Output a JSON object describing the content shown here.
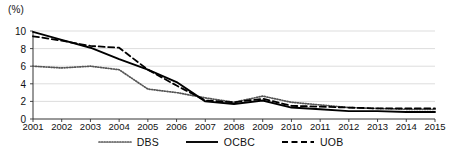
{
  "chart_data": {
    "type": "line",
    "title": "",
    "subtitle": "",
    "xlabel": "",
    "ylabel": "(%)",
    "unit_label": "(%)",
    "grid": true,
    "legend_position": "bottom",
    "xlim": [
      2001,
      2015
    ],
    "ylim": [
      0,
      10
    ],
    "yticks": [
      "0",
      "2",
      "4",
      "6",
      "8",
      "10"
    ],
    "ytick_values": [
      0,
      2,
      4,
      6,
      8,
      10
    ],
    "categories": [
      "2001",
      "2002",
      "2003",
      "2004",
      "2005",
      "2006",
      "2007",
      "2008",
      "2009",
      "2010",
      "2011",
      "2012",
      "2013",
      "2014",
      "2015"
    ],
    "series": [
      {
        "name": "DBS",
        "style": "dotted",
        "color": "#555555",
        "values": [
          6.0,
          5.8,
          6.0,
          5.6,
          3.4,
          3.0,
          2.4,
          1.9,
          2.6,
          1.9,
          1.6,
          1.3,
          1.2,
          1.1,
          1.1
        ]
      },
      {
        "name": "OCBC",
        "style": "solid",
        "color": "#000000",
        "values": [
          9.9,
          9.0,
          8.1,
          6.8,
          5.6,
          4.2,
          2.0,
          1.7,
          2.1,
          1.3,
          1.1,
          0.9,
          0.9,
          0.8,
          0.8
        ]
      },
      {
        "name": "UOB",
        "style": "dashed",
        "color": "#000000",
        "values": [
          9.4,
          8.9,
          8.3,
          8.1,
          5.6,
          3.8,
          2.1,
          1.9,
          2.3,
          1.5,
          1.4,
          1.3,
          1.2,
          1.2,
          1.2
        ]
      }
    ]
  },
  "legend": {
    "items": [
      {
        "label": "DBS"
      },
      {
        "label": "OCBC"
      },
      {
        "label": "UOB"
      }
    ]
  }
}
